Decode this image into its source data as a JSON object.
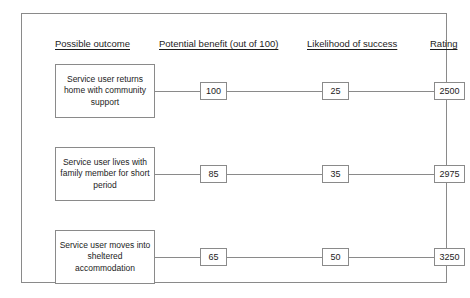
{
  "diagram": {
    "type": "decision-tree-table",
    "headers": {
      "outcome": "Possible outcome",
      "benefit": "Potential benefit (out of 100)",
      "likelihood": "Likelihood of success",
      "rating": "Rating"
    },
    "rows": [
      {
        "outcome": "Service user returns home with community support",
        "benefit": "100",
        "likelihood": "25",
        "rating": "2500"
      },
      {
        "outcome": "Service user lives with family member for short period",
        "benefit": "85",
        "likelihood": "35",
        "rating": "2975"
      },
      {
        "outcome": "Service user moves into sheltered accommodation",
        "benefit": "65",
        "likelihood": "50",
        "rating": "3250"
      }
    ]
  },
  "colors": {
    "border": "#8a8a8a",
    "text": "#1c1c1c",
    "background": "#ffffff"
  }
}
